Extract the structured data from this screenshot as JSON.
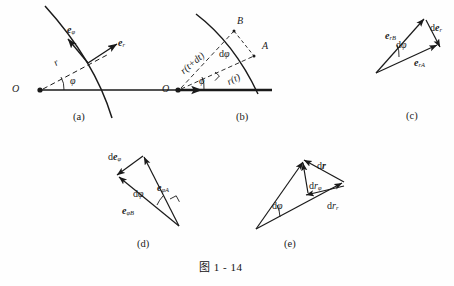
{
  "figure": {
    "caption": "图 1 - 14",
    "line_color": "#1a1a1a",
    "bg_color": "#fefefe"
  },
  "panels": [
    {
      "id": "a",
      "label": "(a)",
      "origin_label": "O",
      "radius_label": "r",
      "angle_label": "φ",
      "unit_vector_phi": "e",
      "unit_vector_phi_sub": "φ",
      "unit_vector_r": "e",
      "unit_vector_r_sub": "r"
    },
    {
      "id": "b",
      "label": "(b)",
      "origin_label": "O",
      "point_b": "B",
      "point_a": "A",
      "radius_new": "r(t+dt)",
      "radius_old": "r(t)",
      "angle_label": "φ",
      "d_angle_prefix": "d",
      "d_angle_label": "φ"
    },
    {
      "id": "c",
      "label": "(c)",
      "vec_rb": "e",
      "vec_rb_sub": "rB",
      "vec_ra": "e",
      "vec_ra_sub": "rA",
      "d_vec_prefix": "d",
      "d_vec": "e",
      "d_vec_sub": "r",
      "d_angle_prefix": "d",
      "d_angle_label": "φ"
    },
    {
      "id": "d",
      "label": "(d)",
      "vec_pb": "e",
      "vec_pb_sub": "φB",
      "vec_pa": "e",
      "vec_pa_sub": "φA",
      "d_vec_prefix": "d",
      "d_vec": "e",
      "d_vec_sub": "φ",
      "d_angle_prefix": "d",
      "d_angle_label": "φ"
    },
    {
      "id": "e",
      "label": "(e)",
      "d_r_prefix": "d",
      "d_r": "r",
      "d_r_phi_prefix": "d",
      "d_r_phi": "r",
      "d_r_phi_sub": "φ",
      "d_r_r_prefix": "d",
      "d_r_r": "r",
      "d_r_r_sub": "r",
      "d_angle_prefix": "d",
      "d_angle_label": "φ"
    }
  ],
  "diagram_data": {
    "type": "vector-geometry-diagram",
    "description": "Polar coordinate unit vectors and their differentials",
    "panel_a": {
      "origin": [
        40,
        90
      ],
      "axis_end": [
        207,
        90
      ],
      "radius_tip": [
        90,
        63
      ],
      "angle_deg": 28,
      "arc_through": [
        45,
        6,
        140,
        118
      ]
    },
    "panel_b": {
      "origin": [
        177,
        90
      ],
      "axis_end": [
        277,
        90
      ],
      "point_a": [
        253,
        55
      ],
      "point_b": [
        233,
        30
      ],
      "angle_phi_deg": 26,
      "angle_dphi_deg": 15
    },
    "panel_c": {
      "apex": [
        376,
        73
      ],
      "tip_b": [
        424,
        18
      ],
      "tip_a": [
        438,
        46
      ]
    },
    "panel_d": {
      "apex": [
        179,
        226
      ],
      "tip_a": [
        144,
        156
      ],
      "tip_b": [
        118,
        176
      ]
    },
    "panel_e": {
      "apex": [
        256,
        229
      ],
      "tip_top": [
        303,
        160
      ],
      "tip_right": [
        345,
        184
      ],
      "mid": [
        308,
        192
      ]
    }
  }
}
